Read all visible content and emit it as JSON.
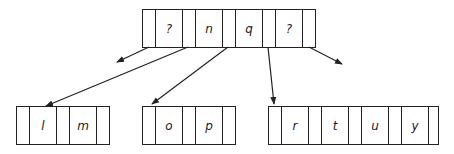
{
  "diagram": {
    "type": "b-tree",
    "root": {
      "keys": [
        "?",
        "n",
        "q",
        "?"
      ]
    },
    "children": [
      {
        "keys": [
          "l",
          "m"
        ]
      },
      {
        "keys": [
          "o",
          "p"
        ]
      },
      {
        "keys": [
          "r",
          "t",
          "u",
          "y"
        ]
      }
    ],
    "edges": [
      {
        "from": "root.ptr0",
        "to": "offscreen-left"
      },
      {
        "from": "root.ptr1",
        "to": "children.0"
      },
      {
        "from": "root.ptr2",
        "to": "children.1"
      },
      {
        "from": "root.ptr3",
        "to": "children.2"
      },
      {
        "from": "root.ptr4",
        "to": "offscreen-right"
      }
    ],
    "line_color": "#222222"
  }
}
